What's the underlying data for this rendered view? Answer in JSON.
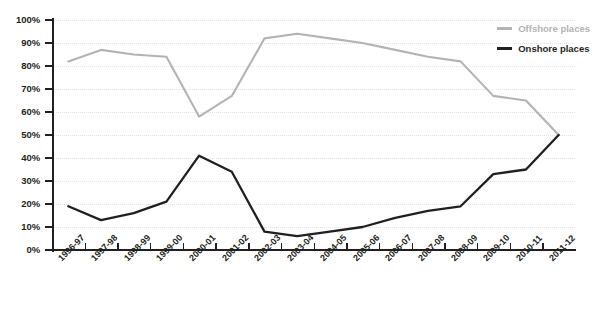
{
  "chart_data": {
    "type": "line",
    "title": "",
    "subtitle": "",
    "xlabel": "",
    "ylabel": "",
    "ylim": [
      0,
      100
    ],
    "ytick_labels": [
      "100%",
      "90%",
      "80%",
      "70%",
      "60%",
      "50%",
      "40%",
      "30%",
      "20%",
      "10%",
      "0%"
    ],
    "ytick_values": [
      100,
      90,
      80,
      70,
      60,
      50,
      40,
      30,
      20,
      10,
      0
    ],
    "grid": true,
    "legend_position": "top-right",
    "categories": [
      "1996-97",
      "1997-98",
      "1998-99",
      "1999-00",
      "2000-01",
      "2001-02",
      "2002-03",
      "2003-04",
      "2004-05",
      "2005-06",
      "2006-07",
      "2007-08",
      "2008-09",
      "2009-10",
      "2010-11",
      "2011-12"
    ],
    "series": [
      {
        "name": "Offshore places",
        "color": "#b3b3b3",
        "values": [
          82,
          87,
          85,
          84,
          58,
          67,
          92,
          94,
          92,
          90,
          87,
          84,
          82,
          67,
          65,
          50
        ]
      },
      {
        "name": "Onshore places",
        "color": "#231f20",
        "values": [
          19,
          13,
          16,
          21,
          41,
          34,
          8,
          6,
          8,
          10,
          14,
          17,
          19,
          33,
          35,
          50
        ]
      }
    ]
  },
  "legend": {
    "items": [
      {
        "label": "Offshore places",
        "color": "#b3b3b3"
      },
      {
        "label": "Onshore places",
        "color": "#231f20"
      }
    ]
  }
}
